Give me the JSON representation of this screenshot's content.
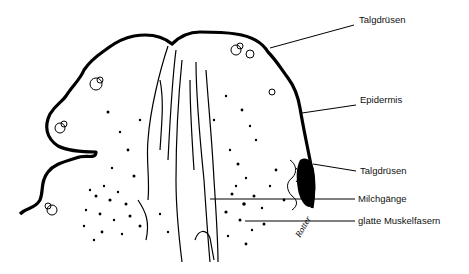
{
  "diagram": {
    "labels": [
      {
        "id": "talgdruesen-top",
        "text": "Talgdrüsen",
        "x": 359,
        "y": 20,
        "line": [
          [
            270,
            48
          ],
          [
            354,
            25
          ]
        ]
      },
      {
        "id": "epidermis",
        "text": "Epidermis",
        "x": 360,
        "y": 99,
        "line": [
          [
            302,
            113
          ],
          [
            356,
            105
          ]
        ]
      },
      {
        "id": "talgdruesen-bottom",
        "text": "Talgdrüsen",
        "x": 360,
        "y": 166,
        "line": [
          [
            313,
            164
          ],
          [
            356,
            171
          ]
        ]
      },
      {
        "id": "milchgaenge",
        "text": "Milchgänge",
        "x": 358,
        "y": 194,
        "line": [
          [
            210,
            199
          ],
          [
            355,
            199
          ]
        ]
      },
      {
        "id": "glatte-muskelfasern",
        "text": "glatte Muskelfasern",
        "x": 358,
        "y": 215,
        "line": [
          [
            245,
            221
          ],
          [
            355,
            221
          ]
        ]
      }
    ],
    "signature": "Rotter"
  }
}
